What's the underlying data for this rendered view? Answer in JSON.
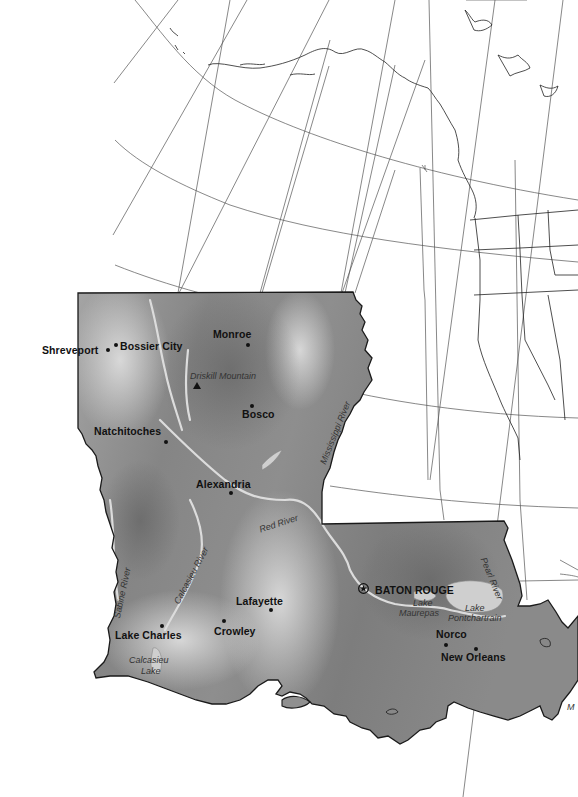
{
  "map": {
    "title": "Louisiana",
    "colors": {
      "background": "#ffffff",
      "graticule": "#555555",
      "state_light": "#c8c8c8",
      "state_dark": "#7a7a7a",
      "border": "#1a1a1a",
      "water": "#d8d8d8",
      "label": "#111111"
    },
    "cities": [
      {
        "name": "Shreveport",
        "label": "Shreveport"
      },
      {
        "name": "Bossier City",
        "label": "Bossier City"
      },
      {
        "name": "Monroe",
        "label": "Monroe"
      },
      {
        "name": "Bosco",
        "label": "Bosco"
      },
      {
        "name": "Natchitoches",
        "label": "Natchitoches"
      },
      {
        "name": "Alexandria",
        "label": "Alexandria"
      },
      {
        "name": "Lafayette",
        "label": "Lafayette"
      },
      {
        "name": "Crowley",
        "label": "Crowley"
      },
      {
        "name": "Lake Charles",
        "label": "Lake Charles"
      },
      {
        "name": "Norco",
        "label": "Norco"
      },
      {
        "name": "New Orleans",
        "label": "New Orleans"
      }
    ],
    "capital": {
      "label": "BATON ROUGE",
      "icon": "star-in-circle-icon"
    },
    "peak": {
      "label": "Driskill Mountain",
      "icon": "triangle-mountain-icon"
    },
    "rivers": [
      {
        "label": "Mississippi River"
      },
      {
        "label": "Red River"
      },
      {
        "label": "Sabine River"
      },
      {
        "label": "Calcasieu River"
      },
      {
        "label": "Pearl River"
      }
    ],
    "lakes": [
      {
        "line1": "Lake",
        "line2": "Maurepas"
      },
      {
        "line1": "Lake",
        "line2": "Pontchartrain"
      },
      {
        "line1": "Calcasieu",
        "line2": "Lake"
      }
    ],
    "edge_fragment": "M"
  }
}
